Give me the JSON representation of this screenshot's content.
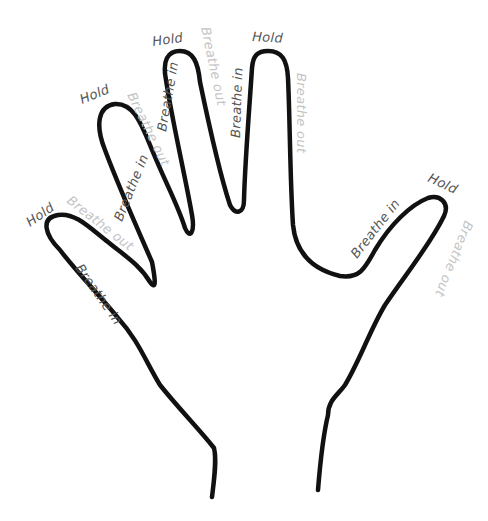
{
  "diagram": {
    "colors": {
      "outline": "#111111",
      "hold_text": "#555555",
      "breathe_in_text": "#555555",
      "breathe_out_text": "#c4c4c4",
      "background": "#ffffff"
    },
    "fingers": [
      {
        "name": "pinky",
        "breathe_in": "Breathe in",
        "hold": "Hold",
        "breathe_out": "Breathe out"
      },
      {
        "name": "ring",
        "breathe_in": "Breathe in",
        "hold": "Hold",
        "breathe_out": "Breathe out"
      },
      {
        "name": "middle",
        "breathe_in": "Breathe in",
        "hold": "Hold",
        "breathe_out": "Breathe out"
      },
      {
        "name": "index",
        "breathe_in": "Breathe in",
        "hold": "Hold",
        "breathe_out": "Breathe out"
      },
      {
        "name": "thumb",
        "breathe_in": "Breathe in",
        "hold": "Hold",
        "breathe_out": "Breathe out"
      }
    ]
  }
}
